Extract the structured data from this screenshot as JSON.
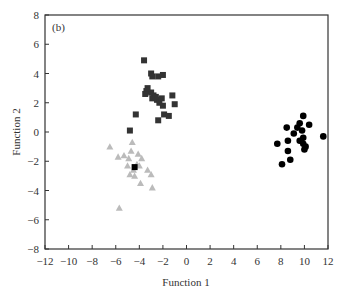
{
  "chart_data": {
    "type": "scatter",
    "panel_label": "(b)",
    "title": "",
    "xlabel": "Function 1",
    "ylabel": "Function 2",
    "xlim": [
      -12,
      12
    ],
    "ylim": [
      -8,
      8
    ],
    "xticks": [
      -12,
      -10,
      -8,
      -6,
      -4,
      -2,
      0,
      2,
      4,
      6,
      8,
      10,
      12
    ],
    "yticks": [
      -8,
      -6,
      -4,
      -2,
      0,
      2,
      4,
      6,
      8
    ],
    "xtick_labels": [
      "−12",
      "−10",
      "−8",
      "−6",
      "−4",
      "−2",
      "0",
      "2",
      "4",
      "6",
      "8",
      "10",
      "12"
    ],
    "ytick_labels": [
      "−8",
      "−6",
      "−4",
      "−2",
      "0",
      "2",
      "4",
      "6",
      "8"
    ],
    "grid": false,
    "legend": "none",
    "series": [
      {
        "name": "group-squares",
        "marker": "square",
        "color": "#333333",
        "points": [
          [
            -3.6,
            4.9
          ],
          [
            -3.0,
            4.0
          ],
          [
            -2.9,
            3.8
          ],
          [
            -2.4,
            3.8
          ],
          [
            -2.0,
            3.9
          ],
          [
            -3.4,
            2.8
          ],
          [
            -3.5,
            2.6
          ],
          [
            -3.0,
            2.7
          ],
          [
            -2.8,
            2.5
          ],
          [
            -2.9,
            2.3
          ],
          [
            -2.6,
            2.4
          ],
          [
            -2.5,
            2.2
          ],
          [
            -2.3,
            2.0
          ],
          [
            -2.1,
            2.3
          ],
          [
            -2.0,
            1.8
          ],
          [
            -1.2,
            2.5
          ],
          [
            -1.0,
            1.9
          ],
          [
            -1.9,
            1.2
          ],
          [
            -1.5,
            1.1
          ],
          [
            -2.4,
            0.8
          ],
          [
            -4.3,
            1.2
          ],
          [
            -4.8,
            0.1
          ],
          [
            -3.3,
            3.0
          ]
        ]
      },
      {
        "name": "group-triangles",
        "marker": "triangle",
        "color": "#bbbbbb",
        "points": [
          [
            -6.5,
            -1.0
          ],
          [
            -4.6,
            -0.7
          ],
          [
            -5.8,
            -1.7
          ],
          [
            -5.3,
            -1.6
          ],
          [
            -4.9,
            -1.8
          ],
          [
            -4.1,
            -1.5
          ],
          [
            -3.8,
            -1.8
          ],
          [
            -4.0,
            -2.3
          ],
          [
            -5.0,
            -2.3
          ],
          [
            -4.5,
            -2.6
          ],
          [
            -4.8,
            -2.9
          ],
          [
            -4.4,
            -3.0
          ],
          [
            -3.3,
            -2.6
          ],
          [
            -3.0,
            -2.9
          ],
          [
            -3.9,
            -3.5
          ],
          [
            -2.9,
            -3.8
          ],
          [
            -5.7,
            -5.2
          ],
          [
            -4.2,
            -2.2
          ],
          [
            -4.7,
            -1.3
          ]
        ]
      },
      {
        "name": "group-square-outlier",
        "marker": "square",
        "color": "#000000",
        "points": [
          [
            -4.4,
            -2.4
          ]
        ]
      },
      {
        "name": "group-circles",
        "marker": "circle",
        "color": "#000000",
        "points": [
          [
            9.9,
            1.1
          ],
          [
            9.6,
            0.6
          ],
          [
            10.4,
            0.5
          ],
          [
            9.4,
            0.3
          ],
          [
            8.5,
            0.3
          ],
          [
            9.1,
            -0.1
          ],
          [
            9.8,
            0.1
          ],
          [
            9.9,
            -0.4
          ],
          [
            9.9,
            -0.8
          ],
          [
            10.1,
            -1.0
          ],
          [
            10.0,
            -1.2
          ],
          [
            8.6,
            -0.6
          ],
          [
            7.7,
            -0.8
          ],
          [
            8.6,
            -1.3
          ],
          [
            8.8,
            -1.9
          ],
          [
            8.1,
            -2.2
          ],
          [
            11.6,
            -0.3
          ],
          [
            9.6,
            -0.6
          ]
        ]
      }
    ]
  }
}
